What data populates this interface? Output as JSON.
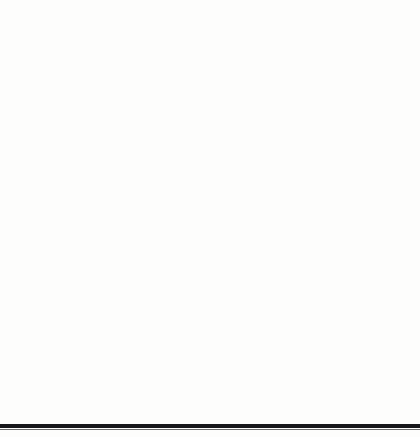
{
  "figure": {
    "panel_label": "(c)"
  },
  "chart_data": [
    {
      "id": "fitness-evaluations",
      "type": "line",
      "title": "",
      "panel": "(c)",
      "xlabel": "Number of Rounds",
      "ylabel": "Fitness Evaluations",
      "xlim": [
        -25,
        525
      ],
      "ylim": [
        -0.6,
        12.9
      ],
      "xticks": [
        0,
        100,
        200,
        300,
        400,
        500
      ],
      "yticks": [
        0,
        2,
        4,
        6,
        8,
        10,
        12
      ],
      "grid": false,
      "legend_position": "top-left",
      "x": [
        0,
        50,
        100,
        150,
        200,
        250,
        300,
        350,
        400,
        450,
        500
      ],
      "series": [
        {
          "name": "CMPS",
          "marker": "circle",
          "linestyle": "solid",
          "values": [
            0.05,
            1.4,
            2.45,
            3.75,
            4.9,
            6.05,
            7.1,
            8.4,
            9.6,
            10.85,
            12.35
          ]
        },
        {
          "name": "CPS",
          "marker": "triangle",
          "linestyle": "solid",
          "values": [
            0.05,
            1.4,
            2.45,
            3.75,
            4.9,
            6.05,
            7.1,
            8.4,
            9.6,
            10.85,
            12.35
          ]
        },
        {
          "name": "FMPS",
          "marker": "square",
          "linestyle": "solid",
          "values": [
            0.05,
            1.4,
            2.45,
            3.75,
            4.9,
            6.05,
            7.1,
            8.4,
            9.6,
            10.85,
            12.35
          ]
        }
      ]
    },
    {
      "id": "objective-throughput",
      "type": "line",
      "title": "",
      "xlabel": "Number of Rounds",
      "ylabel": "Objective Throughput",
      "xlim": [
        25,
        525
      ],
      "ylim": [
        193.5,
        226.5
      ],
      "xticks": [
        100,
        200,
        300,
        400,
        500
      ],
      "yticks": [
        195,
        200,
        205,
        210,
        215,
        220,
        225
      ],
      "grid": false,
      "legend_position": "top-right",
      "x": [
        50,
        100,
        150,
        200,
        250,
        300,
        350,
        400,
        450,
        500
      ],
      "series": [
        {
          "name": "CMPS",
          "marker": "triangle",
          "linestyle": "dashed",
          "values": [
            217.1,
            215.4,
            213.3,
            210.9,
            208.8,
            207.9,
            206.9,
            205.7,
            203.8,
            201.8
          ]
        },
        {
          "name": "CPS",
          "marker": "circle",
          "linestyle": "dashed",
          "values": [
            214.9,
            216.0,
            214.1,
            211.1,
            206.8,
            204.9,
            201.8,
            199.8,
            196.7,
            195.7
          ]
        },
        {
          "name": "FMPS",
          "marker": "square",
          "linestyle": "solid",
          "values": [
            223.0,
            218.9,
            214.8,
            211.8,
            207.8,
            204.9,
            201.8,
            200.7,
            198.7,
            197.8
          ]
        }
      ]
    }
  ]
}
